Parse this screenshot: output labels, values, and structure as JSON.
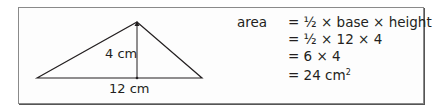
{
  "diagram": {
    "shape": "triangle",
    "height_label": "4 cm",
    "base_label": "12 cm",
    "stroke_color": "#231f20",
    "border_color": "#8a8a8a"
  },
  "calculation": {
    "term": "area",
    "lines": [
      "= ½ × base × height",
      "= ½ × 12 × 4",
      "= 6 × 4",
      "= 24 cm"
    ],
    "unit_exponent": "2"
  }
}
